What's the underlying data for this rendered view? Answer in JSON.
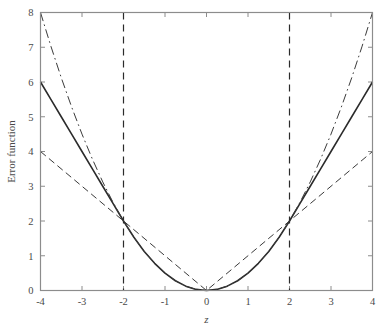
{
  "chart_data": {
    "type": "line",
    "title": "",
    "xlabel": "z",
    "ylabel": "Error function",
    "xlim": [
      -4,
      4
    ],
    "ylim": [
      0,
      8
    ],
    "xticks": [
      -4,
      -3,
      -2,
      -1,
      0,
      1,
      2,
      3,
      4
    ],
    "xticklabels": [
      "-4",
      "-3",
      "-2",
      "-1",
      "0",
      "1",
      "2",
      "3",
      "4"
    ],
    "yticks": [
      0,
      1,
      2,
      3,
      4,
      5,
      6,
      7,
      8
    ],
    "yticklabels": [
      "0",
      "1",
      "2",
      "3",
      "4",
      "5",
      "6",
      "7",
      "8"
    ],
    "grid": false,
    "legend": "none",
    "frame": "box",
    "tick_direction": "in",
    "series": [
      {
        "name": "huber",
        "style": "solid",
        "color": "#2b2b2b",
        "width": 1.6,
        "description": "Quadratic inside |z|<=2, linear outside; passes through (-4,6),(-2,2),(0,0),(2,2),(4,6)",
        "x": [
          -4,
          -3.75,
          -3.5,
          -3.25,
          -3,
          -2.75,
          -2.5,
          -2.25,
          -2,
          -1.75,
          -1.5,
          -1.25,
          -1,
          -0.75,
          -0.5,
          -0.25,
          0,
          0.25,
          0.5,
          0.75,
          1,
          1.25,
          1.5,
          1.75,
          2,
          2.25,
          2.5,
          2.75,
          3,
          3.25,
          3.5,
          3.75,
          4
        ],
        "y": [
          6,
          5.5,
          5,
          4.5,
          4,
          3.5,
          3,
          2.5,
          2,
          1.53125,
          1.125,
          0.78125,
          0.5,
          0.28125,
          0.125,
          0.03125,
          0,
          0.03125,
          0.125,
          0.28125,
          0.5,
          0.78125,
          1.125,
          1.53125,
          2,
          2.5,
          3,
          3.5,
          4,
          4.5,
          5,
          5.5,
          6
        ]
      },
      {
        "name": "quadratic",
        "style": "dashdot",
        "color": "#3a3a3a",
        "width": 1.0,
        "description": "Pure quadratic z^2/2; passes through (-4,8),(-2,2),(0,0),(2,2),(4,8)",
        "x": [
          -4,
          -3.75,
          -3.5,
          -3.25,
          -3,
          -2.75,
          -2.5,
          -2.25,
          -2,
          -1.75,
          -1.5,
          -1.25,
          -1,
          -0.75,
          -0.5,
          -0.25,
          0,
          0.25,
          0.5,
          0.75,
          1,
          1.25,
          1.5,
          1.75,
          2,
          2.25,
          2.5,
          2.75,
          3,
          3.25,
          3.5,
          3.75,
          4
        ],
        "y": [
          8,
          7.03125,
          6.125,
          5.28125,
          4.5,
          3.78125,
          3.125,
          2.53125,
          2,
          1.53125,
          1.125,
          0.78125,
          0.5,
          0.28125,
          0.125,
          0.03125,
          0,
          0.03125,
          0.125,
          0.28125,
          0.5,
          0.78125,
          1.125,
          1.53125,
          2,
          2.53125,
          3.125,
          3.78125,
          4.5,
          5.28125,
          6.125,
          7.03125,
          8
        ]
      },
      {
        "name": "absolute",
        "style": "dashed",
        "color": "#3a3a3a",
        "width": 1.0,
        "description": "Absolute value |z|; passes through (-4,4),(-2,2),(0,0),(2,2),(4,4)",
        "x": [
          -4,
          -2,
          0,
          2,
          4
        ],
        "y": [
          4,
          2,
          0,
          2,
          4
        ]
      }
    ],
    "reference_lines": [
      {
        "name": "threshold-left",
        "orientation": "vertical",
        "value": -2,
        "style": "dashed",
        "color": "#2b2b2b",
        "width": 1.2
      },
      {
        "name": "threshold-right",
        "orientation": "vertical",
        "value": 2,
        "style": "dashed",
        "color": "#2b2b2b",
        "width": 1.2
      }
    ],
    "annotations": [],
    "intersections": [
      {
        "x": -2,
        "y": 2
      },
      {
        "x": 2,
        "y": 2
      },
      {
        "x": 0,
        "y": 0
      }
    ]
  },
  "style": {
    "background": "#ffffff",
    "axis_color": "#8c8c8c",
    "text_color": "#4a4a4a"
  }
}
